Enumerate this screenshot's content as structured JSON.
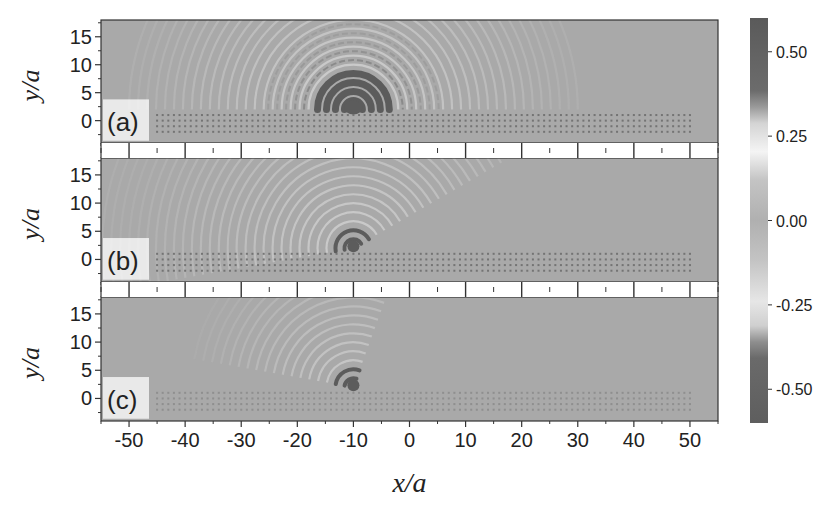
{
  "chart_data": {
    "type": "heatmap",
    "title": "",
    "xlabel": "x/a",
    "ylabel": "y/a",
    "xlim": [
      -55,
      55
    ],
    "ylim": [
      -4,
      18
    ],
    "x_ticks": [
      -50,
      -40,
      -30,
      -20,
      -10,
      0,
      10,
      20,
      30,
      40,
      50
    ],
    "x_tick_labels": [
      "-50",
      "-40",
      "-30",
      "-20",
      "-10",
      "0",
      "10",
      "20",
      "30",
      "40",
      "50"
    ],
    "y_ticks": [
      0,
      5,
      10,
      15
    ],
    "y_tick_labels": [
      "0",
      "5",
      "10",
      "15"
    ],
    "grid": false,
    "panels": [
      {
        "label": "(a)",
        "source_x": -10,
        "source_y": 2,
        "description": "Strong semicircular wave fronts centered at x/a=-10 radiating upward; dark (high amplitude) rings near source, lighter rings extending to full panel; lattice of dots from x/a=-45 to 50, y/a=-2 to 1",
        "max_ring_radius": 40
      },
      {
        "label": "(b)",
        "source_x": -10,
        "source_y": 2,
        "description": "Wave fronts tilted toward left; weaker amplitude near source, rings extend left to x/a=-55; lattice of dots",
        "max_ring_radius": 45
      },
      {
        "label": "(c)",
        "source_x": -10,
        "source_y": 2,
        "description": "Faint wave fronts directed to upper-left, confined wedge; small dark core at source; lattice faint",
        "max_ring_radius": 30
      }
    ],
    "colorbar": {
      "ticks": [
        0.5,
        0.25,
        0.0,
        -0.25,
        -0.5
      ],
      "tick_labels": [
        "0.50",
        "0.25",
        "0.00",
        "-0.25",
        "-0.50"
      ],
      "range": [
        -0.6,
        0.6
      ],
      "colormap": "gray-diverging (dark at extremes, light near ±0.2, mid-gray at 0)"
    },
    "lattice": {
      "x_range": [
        -45,
        50
      ],
      "rows_y": [
        1,
        0,
        -1,
        -2
      ]
    }
  },
  "axes": {
    "xlabel": "x/a",
    "ylabel": "y/a"
  },
  "colors": {
    "background_field": "#a9a9a9",
    "dark_wave": "#5c5c5c",
    "light_wave": "#d8d8d8",
    "lattice_dot": "#6e6e6e",
    "axis": "#333333",
    "text": "#222222"
  }
}
